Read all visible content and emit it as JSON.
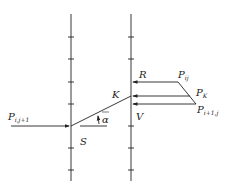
{
  "diagram": {
    "type": "ray-tracing / characteristic diagram",
    "labels": {
      "left_point": {
        "base": "P",
        "sub": "i,j+1"
      },
      "point_ij": {
        "base": "P",
        "sub": "ij"
      },
      "point_k": {
        "base": "P",
        "sub": "K"
      },
      "point_i1j": {
        "base": "P",
        "sub": "i+1,j"
      },
      "R": "R",
      "K": "K",
      "V": "V",
      "S": "S",
      "alpha": "α"
    },
    "colors": {
      "line": "#222222",
      "background": "#ffffff"
    }
  }
}
